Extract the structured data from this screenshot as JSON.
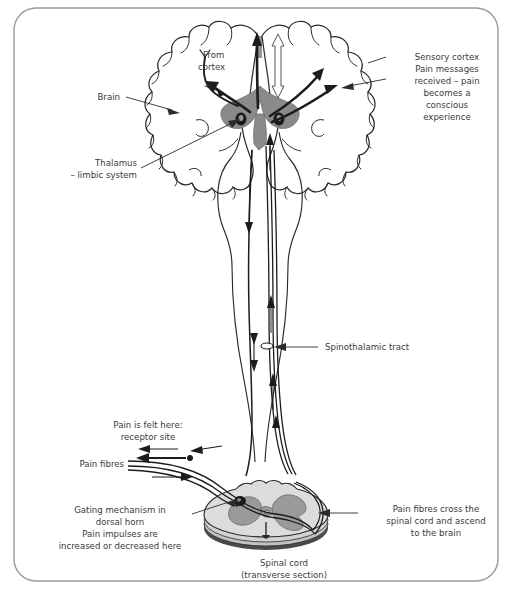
{
  "figure": {
    "frame_color": "#8c8c8c",
    "background": "#ffffff",
    "text_color": "#3a3a3a",
    "grey_matter_color": "#9a9a9a",
    "cord_fill_color": "#d9d9d9",
    "thalamus_color": "#8f8f8f"
  },
  "labels": {
    "brain": "Brain",
    "from_cortex": [
      "From",
      "cortex"
    ],
    "thalamus": [
      "Thalamus",
      "– limbic system"
    ],
    "sensory_cortex": [
      "Sensory cortex",
      "Pain messages",
      "received – pain",
      "becomes a",
      "conscious",
      "experience"
    ],
    "spinothalamic_tract": "Spinothalamic tract",
    "pain_felt": [
      "Pain is felt here:",
      "receptor site"
    ],
    "pain_fibres": "Pain fibres",
    "gating": [
      "Gating mechanism in",
      "dorsal horn",
      "Pain impulses are",
      "increased or decreased here"
    ],
    "cross_ascend": [
      "Pain fibres cross the",
      "spinal cord and ascend",
      "to the brain"
    ],
    "spinal_cord": [
      "Spinal cord",
      "(transverse section)"
    ]
  },
  "structures": {
    "brain_name": "cerebral-hemispheres",
    "thalamus_name": "thalamus-limbic-system",
    "brainstem_name": "brainstem",
    "cord_name": "spinal-cord-transverse-section",
    "tract_name": "spinothalamic-tract",
    "synapse_name": "dorsal-horn-synapse"
  }
}
